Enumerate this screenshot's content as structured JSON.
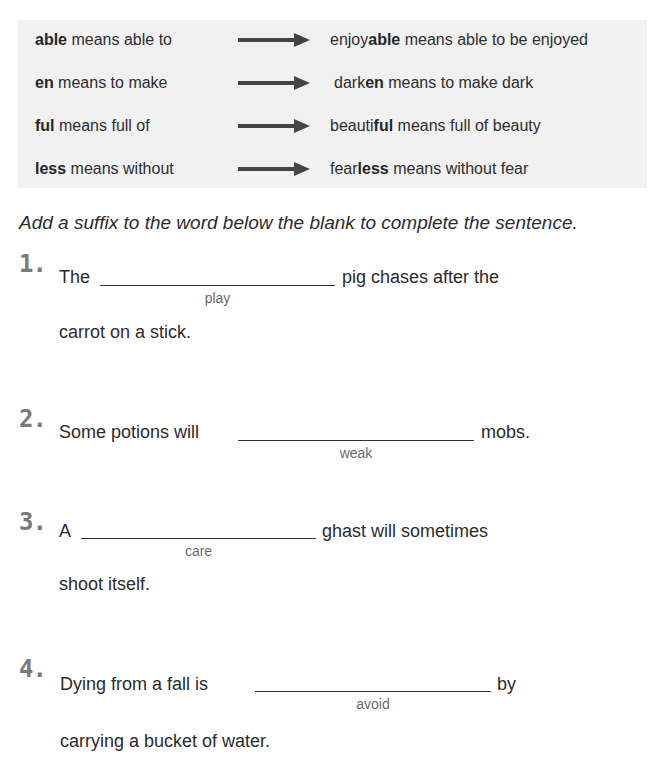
{
  "suffix_table": {
    "rows": [
      {
        "suffix": "able",
        "rule_rest": " means able to",
        "example_pre": "enjoy",
        "example_suffix": "able",
        "example_rest": " means able to be enjoyed",
        "arrow_icon": "right-arrow"
      },
      {
        "suffix": "en",
        "rule_rest": " means to make",
        "example_pre": "dark",
        "example_suffix": "en",
        "example_rest": " means to make dark",
        "arrow_icon": "right-arrow"
      },
      {
        "suffix": "ful",
        "rule_rest": " means full of",
        "example_pre": "beauti",
        "example_suffix": "ful",
        "example_rest": " means full of beauty",
        "arrow_icon": "right-arrow"
      },
      {
        "suffix": "less",
        "rule_rest": " means without",
        "example_pre": "fear",
        "example_suffix": "less",
        "example_rest": " means without fear",
        "arrow_icon": "right-arrow"
      }
    ]
  },
  "instruction": "Add a suffix to the word below the blank to complete the sentence.",
  "questions": [
    {
      "number": "1.",
      "before": "The",
      "after": "pig chases after the",
      "base_word": "play",
      "line2": "carrot on a stick.",
      "answer": ""
    },
    {
      "number": "2.",
      "before": "Some potions will",
      "after": "mobs.",
      "base_word": "weak",
      "line2": "",
      "answer": ""
    },
    {
      "number": "3.",
      "before": "A",
      "after": "ghast will sometimes",
      "base_word": "care",
      "line2": "shoot itself.",
      "answer": ""
    },
    {
      "number": "4.",
      "before": "Dying from a fall is",
      "after": "by",
      "base_word": "avoid",
      "line2": "carrying a bucket of water.",
      "answer": ""
    }
  ],
  "colors": {
    "box_background": "#f1f1f1",
    "arrow": "#444444",
    "number": "#7a7a7a",
    "text": "#2b2b2b",
    "hint": "#6a6a6a"
  }
}
